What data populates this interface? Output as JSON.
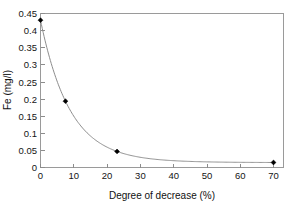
{
  "chart_data": {
    "type": "line",
    "title": "",
    "subtitle": "",
    "xlabel": "Degree of decrease (%)",
    "ylabel": "Fe (mg/l)",
    "xlim": [
      0,
      73
    ],
    "ylim": [
      0,
      0.46
    ],
    "xticks": [
      0,
      10,
      20,
      30,
      40,
      50,
      60,
      70
    ],
    "xtick_labels": [
      "0",
      "10",
      "20",
      "30",
      "40",
      "50",
      "60",
      "70"
    ],
    "yticks": [
      0,
      0.05,
      0.1,
      0.15,
      0.2,
      0.25,
      0.3,
      0.35,
      0.4,
      0.45
    ],
    "ytick_labels": [
      "0",
      "0.05",
      "0.1",
      "0.15",
      "0.2",
      "0.25",
      "0.3",
      "0.35",
      "0.4",
      "0.45"
    ],
    "grid": false,
    "legend": null,
    "legend_position": "none",
    "marker_style": "filled-diamond",
    "line_color": "#8d8d8d",
    "marker_color": "#000000",
    "frame": "box",
    "series": [
      {
        "name": "Fe concentration",
        "x": [
          0,
          7.5,
          23,
          70
        ],
        "values": [
          0.44,
          0.198,
          0.048,
          0.015
        ]
      }
    ],
    "fitted_curve_note": "smooth exponential-like decay through the four markers",
    "annotations": []
  },
  "axis_titles": {
    "x": "Degree of decrease (%)",
    "y": "Fe (mg/l)"
  }
}
